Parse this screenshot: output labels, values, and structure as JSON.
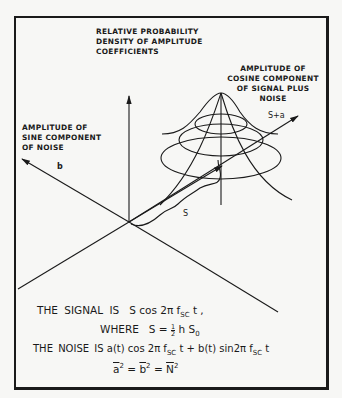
{
  "labels": {
    "vertical_axis": [
      "RELATIVE PROBABILITY",
      "DENSITY OF AMPLITUDE",
      "COEFFICIENTS"
    ],
    "cosine_axis": [
      "AMPLITUDE OF",
      "COSINE COMPONENT",
      "OF SIGNAL PLUS",
      "NOISE"
    ],
    "sine_axis": [
      "AMPLITUDE OF",
      "SINE COMPONENT",
      "OF NOISE"
    ],
    "cosine_axis_symbol": "S+a",
    "sine_axis_symbol": "b",
    "signal_vector_symbol": "S"
  },
  "equations": {
    "signal_prefix": "THE  SIGNAL  IS",
    "signal_expr": "S cos 2π f",
    "signal_sub": "SC",
    "signal_suffix": " t ,",
    "where_prefix": "WHERE",
    "where_expr_1": "S = ",
    "where_frac_num": "1",
    "where_frac_den": "2",
    "where_expr_2": " h S",
    "where_sub": "0",
    "noise_prefix": "THE  NOISE  IS",
    "noise_expr_1": "a(t) cos 2π f",
    "noise_sub_1": "SC",
    "noise_expr_2": " t + b(t) sin2π f",
    "noise_sub_2": "SC",
    "noise_expr_3": " t",
    "variance_a": "a",
    "variance_b": "b",
    "variance_n": "N",
    "power": "2",
    "equals": "="
  },
  "colors": {
    "ink": "#1a1a1a",
    "paper": "#f7f7f5"
  }
}
